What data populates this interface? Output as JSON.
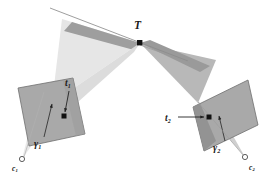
{
  "figure": {
    "background_color": "#ffffff",
    "width": 269,
    "height": 178
  },
  "labels": {
    "scene_point": "T",
    "image_point_left": "t",
    "image_point_left_sub": "1",
    "image_point_right": "t",
    "image_point_right_sub": "2",
    "ray_left": "γ",
    "ray_left_sub": "1",
    "ray_right": "γ",
    "ray_right_sub": "2",
    "camera_center_left": "c",
    "camera_center_left_sub": "1",
    "camera_center_right": "c",
    "camera_center_right_sub": "2"
  },
  "colors": {
    "plane_fill": "#a9a9a9",
    "plane_stroke": "#6b6b6b",
    "cone_left_fill": "#e4e4e4",
    "cone_right_fill": "#b6b6b6",
    "cone_overlap_fill": "#9a9a9a",
    "cone_lower_fill": "#d2d2d2",
    "point_fill": "#111111",
    "line_stroke": "#8a8a8a",
    "arrow_stroke": "#222222",
    "label_color": "#1a1a1a",
    "camera_marker_stroke": "#555555"
  },
  "geometry": {
    "left_plane_corners": [
      [
        18,
        88
      ],
      [
        73,
        78
      ],
      [
        85,
        134
      ],
      [
        29,
        146
      ]
    ],
    "right_plane_corners": [
      [
        193,
        107
      ],
      [
        248,
        80
      ],
      [
        258,
        125
      ],
      [
        204,
        151
      ]
    ],
    "scene_point_T": [
      140,
      43
    ],
    "image_point_t1": [
      64,
      116
    ],
    "image_point_t2": [
      209,
      117
    ],
    "camera_center_c1": [
      22,
      159
    ],
    "camera_center_c2": [
      245,
      157
    ],
    "epipolar_line_start": [
      50,
      8
    ],
    "epipolar_line_end": [
      188,
      61
    ],
    "left_cone_upper": [
      [
        140,
        43
      ],
      [
        68,
        22
      ],
      [
        60,
        100
      ]
    ],
    "right_cone_upper": [
      [
        140,
        43
      ],
      [
        196,
        100
      ],
      [
        214,
        62
      ]
    ]
  },
  "elements": {
    "scene_point_name": "scene-point-T",
    "left_plane_name": "left-image-plane",
    "right_plane_name": "right-image-plane",
    "left_cone_name": "left-ray-cone",
    "right_cone_name": "right-ray-cone"
  }
}
